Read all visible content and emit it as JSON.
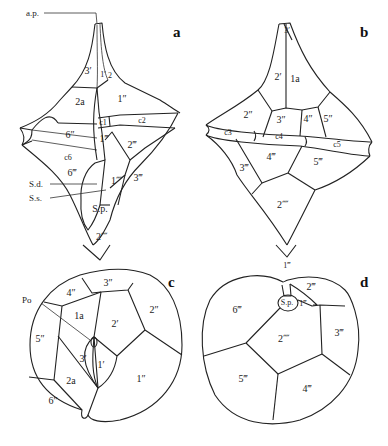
{
  "figure": {
    "panels": [
      {
        "id": "a",
        "label": "a",
        "plates": {
          "p3p": "3′",
          "p1p": "1′",
          "p2": "2",
          "p2a": "2a",
          "p1pp": "1″",
          "p6pp": "6″",
          "c1": "c1",
          "c2": "c2",
          "c6": "c6",
          "p1ppp": "1‴",
          "p2ppp": "2‴",
          "p6ppp": "6‴",
          "p1pppp": "1⁗",
          "p3ppp": "3‴",
          "sp": "S.p.",
          "p2pppp": "2⁗"
        },
        "annotations": {
          "ap": "a.p.",
          "sd": "S.d.",
          "ss": "S.s."
        }
      },
      {
        "id": "b",
        "label": "b",
        "plates": {
          "p3p": "3′",
          "p2p": "2′",
          "p1a": "1a",
          "p2pp": "2″",
          "p3pp": "3″",
          "p4pp": "4″",
          "p5pp": "5″",
          "c3": "c3",
          "c4": "c4",
          "c5": "c5",
          "p3ppp": "3‴",
          "p4ppp": "4‴",
          "p5ppp": "5‴",
          "p2pppp": "2⁗"
        }
      },
      {
        "id": "c",
        "label": "c",
        "plates": {
          "p3pp": "3″",
          "p4pp": "4″",
          "p2pp": "2″",
          "p1a": "1a",
          "p2p": "2′",
          "p5pp": "5″",
          "p3p": "3′",
          "p1p": "1′",
          "p2a": "2a",
          "p1pp": "1″",
          "p6pp": "6″"
        },
        "annotations": {
          "po": "Po"
        }
      },
      {
        "id": "d",
        "label": "d",
        "plates": {
          "p1ppp_top": "1‴",
          "p2ppp": "2‴",
          "sp": "S.p.",
          "p1ppp": "1‴",
          "p6ppp": "6‴",
          "p2pppp": "2⁗",
          "p3ppp": "3‴",
          "p5ppp": "5‴",
          "p4ppp": "4‴"
        }
      }
    ]
  }
}
